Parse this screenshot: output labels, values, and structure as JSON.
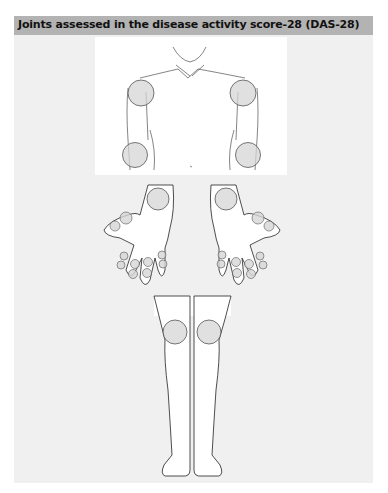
{
  "header": {
    "title": "Joints assessed in the disease activity score-28 (DAS-28)"
  },
  "colors": {
    "header_bg": "#b3b3b3",
    "panel_bg": "#f0f0f0",
    "joint_fill": "#d6d6d6"
  },
  "figure": {
    "sections": [
      "upper-body",
      "hands",
      "legs"
    ],
    "joints": {
      "shoulders": 2,
      "elbows": 2,
      "wrists": 2,
      "metacarpophalangeal": 10,
      "proximal_interphalangeal": 10,
      "knees": 2,
      "total": 28
    }
  }
}
